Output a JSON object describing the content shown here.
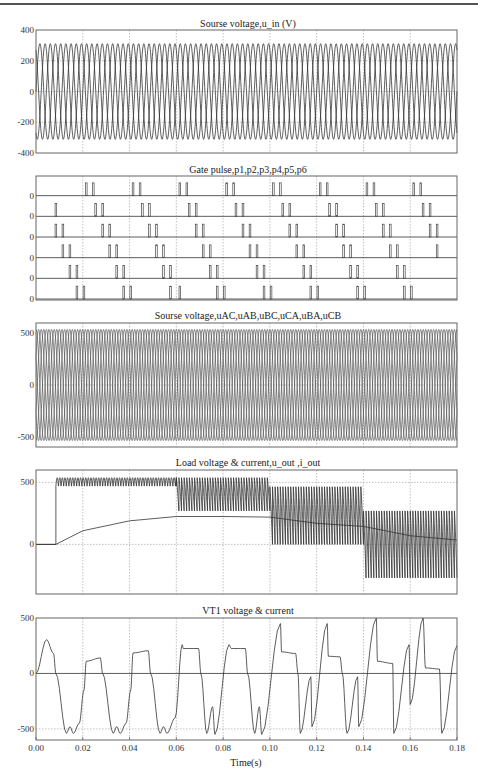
{
  "chart_data": [
    {
      "type": "line",
      "title": "Sourse voltage,u_in (V)",
      "xlabel": "",
      "ylabel": "",
      "xlim": [
        0,
        0.18
      ],
      "ylim": [
        -400,
        400
      ],
      "yticks": [
        "400",
        "200",
        "0",
        "-200",
        "-400"
      ],
      "grid": true,
      "series": [
        {
          "name": "u_a",
          "amplitude": 311,
          "frequency_hz": 150,
          "phase_deg": 0
        },
        {
          "name": "u_b",
          "amplitude": 311,
          "frequency_hz": 150,
          "phase_deg": -120
        },
        {
          "name": "u_c",
          "amplitude": 311,
          "frequency_hz": 150,
          "phase_deg": 120
        }
      ]
    },
    {
      "type": "line",
      "title": "Gate pulse,p1,p2,p3,p4,p5,p6",
      "xlabel": "",
      "xlim": [
        0,
        0.18
      ],
      "yticks": [
        "0",
        "0",
        "0",
        "0",
        "0",
        "0"
      ],
      "grid": true,
      "series": [
        {
          "name": "p1",
          "pulse_times": [
            0.0215,
            0.0245,
            0.0415,
            0.0445,
            0.0615,
            0.0645,
            0.0815,
            0.0845,
            0.1015,
            0.1045,
            0.1215,
            0.1245,
            0.1415,
            0.1445,
            0.1615,
            0.1645
          ]
        },
        {
          "name": "p2",
          "pulse_times": [
            0.0085,
            0.0255,
            0.0285,
            0.0455,
            0.0485,
            0.0655,
            0.0685,
            0.0855,
            0.0885,
            0.1055,
            0.1085,
            0.1255,
            0.1285,
            0.1455,
            0.1485,
            0.1655,
            0.1685
          ]
        },
        {
          "name": "p3",
          "pulse_times": [
            0.0085,
            0.0115,
            0.0285,
            0.0315,
            0.0485,
            0.0515,
            0.0685,
            0.0715,
            0.0885,
            0.0915,
            0.1085,
            0.1115,
            0.1285,
            0.1315,
            0.1485,
            0.1515,
            0.1685,
            0.1715
          ]
        },
        {
          "name": "p4",
          "pulse_times": [
            0.0115,
            0.0145,
            0.0315,
            0.0345,
            0.0515,
            0.0545,
            0.0715,
            0.0745,
            0.0915,
            0.0945,
            0.1115,
            0.1145,
            0.1315,
            0.1345,
            0.1515,
            0.1545,
            0.1715
          ]
        },
        {
          "name": "p5",
          "pulse_times": [
            0.0145,
            0.0175,
            0.0345,
            0.0375,
            0.0545,
            0.0575,
            0.0745,
            0.0775,
            0.0945,
            0.0975,
            0.1145,
            0.1175,
            0.1345,
            0.1375,
            0.1545,
            0.1575
          ]
        },
        {
          "name": "p6",
          "pulse_times": [
            0.0175,
            0.0205,
            0.0375,
            0.0405,
            0.0575,
            0.0615,
            0.0775,
            0.0805,
            0.0975,
            0.1005,
            0.1175,
            0.1205,
            0.1375,
            0.1405,
            0.1575,
            0.1605
          ]
        }
      ]
    },
    {
      "type": "line",
      "title": "Sourse voltage,uAC,uAB,uBC,uCA,uBA,uCB",
      "xlabel": "",
      "xlim": [
        0,
        0.18
      ],
      "ylim": [
        -600,
        600
      ],
      "yticks": [
        "500",
        "0",
        "-500"
      ],
      "grid": true,
      "series": [
        {
          "name": "uAC",
          "amplitude": 538,
          "frequency_hz": 150,
          "phase_deg": -30
        },
        {
          "name": "uAB",
          "amplitude": 538,
          "frequency_hz": 150,
          "phase_deg": 30
        },
        {
          "name": "uBC",
          "amplitude": 538,
          "frequency_hz": 150,
          "phase_deg": -90
        },
        {
          "name": "uCA",
          "amplitude": 538,
          "frequency_hz": 150,
          "phase_deg": 150
        },
        {
          "name": "uBA",
          "amplitude": 538,
          "frequency_hz": 150,
          "phase_deg": 210
        },
        {
          "name": "uCB",
          "amplitude": 538,
          "frequency_hz": 150,
          "phase_deg": 90
        }
      ]
    },
    {
      "type": "line",
      "title": "Load voltage & current,u_out ,i_out",
      "xlabel": "",
      "xlim": [
        0,
        0.18
      ],
      "ylim": [
        -400,
        600
      ],
      "yticks": [
        "500",
        "0"
      ],
      "grid": true,
      "series": [
        {
          "name": "u_out",
          "segments": [
            {
              "t_start": 0.0,
              "t_end": 0.0085,
              "value": 0
            },
            {
              "t_start": 0.0085,
              "t_end": 0.06,
              "ripple_min": 470,
              "ripple_max": 538
            },
            {
              "t_start": 0.06,
              "t_end": 0.1,
              "ripple_min": 270,
              "ripple_max": 538
            },
            {
              "t_start": 0.1,
              "t_end": 0.14,
              "ripple_min": 0,
              "ripple_max": 465
            },
            {
              "t_start": 0.14,
              "t_end": 0.18,
              "ripple_min": -270,
              "ripple_max": 270
            }
          ]
        },
        {
          "name": "i_out",
          "points": [
            [
              0.0,
              0
            ],
            [
              0.0085,
              0
            ],
            [
              0.02,
              110
            ],
            [
              0.04,
              190
            ],
            [
              0.06,
              225
            ],
            [
              0.08,
              225
            ],
            [
              0.1,
              220
            ],
            [
              0.12,
              170
            ],
            [
              0.14,
              145
            ],
            [
              0.16,
              70
            ],
            [
              0.18,
              35
            ]
          ]
        }
      ]
    },
    {
      "type": "line",
      "title": "VT1 voltage & current",
      "xlabel": "Time(s)",
      "xlim": [
        0,
        0.18
      ],
      "ylim": [
        -600,
        500
      ],
      "xticks": [
        "0.00",
        "0.02",
        "0.04",
        "0.06",
        "0.08",
        "0.10",
        "0.12",
        "0.14",
        "0.16",
        "0.18"
      ],
      "yticks": [
        "500",
        "0",
        "-500"
      ],
      "grid": true,
      "series": [
        {
          "name": "VT1_voltage",
          "points": [
            [
              0.0,
              0
            ],
            [
              0.0045,
              305
            ],
            [
              0.0075,
              180
            ],
            [
              0.0085,
              0
            ],
            [
              0.013,
              -540
            ],
            [
              0.0145,
              -480
            ],
            [
              0.016,
              -540
            ],
            [
              0.0185,
              -450
            ],
            [
              0.0205,
              -150
            ],
            [
              0.0215,
              110
            ],
            [
              0.0275,
              140
            ],
            [
              0.0285,
              0
            ],
            [
              0.033,
              -540
            ],
            [
              0.0345,
              -480
            ],
            [
              0.036,
              -540
            ],
            [
              0.0385,
              -450
            ],
            [
              0.0405,
              -150
            ],
            [
              0.0415,
              185
            ],
            [
              0.048,
              205
            ],
            [
              0.049,
              0
            ],
            [
              0.053,
              -540
            ],
            [
              0.0545,
              -480
            ],
            [
              0.056,
              -540
            ],
            [
              0.0595,
              -400
            ],
            [
              0.0625,
              260
            ],
            [
              0.063,
              225
            ],
            [
              0.0695,
              225
            ],
            [
              0.0705,
              0
            ],
            [
              0.073,
              -540
            ],
            [
              0.0755,
              -300
            ],
            [
              0.0765,
              -550
            ],
            [
              0.0825,
              260
            ],
            [
              0.0835,
              225
            ],
            [
              0.0895,
              225
            ],
            [
              0.0905,
              0
            ],
            [
              0.0935,
              -540
            ],
            [
              0.0955,
              -300
            ],
            [
              0.0965,
              -550
            ],
            [
              0.1045,
              450
            ],
            [
              0.105,
              195
            ],
            [
              0.111,
              180
            ],
            [
              0.112,
              0
            ],
            [
              0.113,
              -540
            ],
            [
              0.1175,
              -30
            ],
            [
              0.118,
              -480
            ],
            [
              0.1245,
              450
            ],
            [
              0.125,
              155
            ],
            [
              0.13,
              150
            ],
            [
              0.131,
              0
            ],
            [
              0.133,
              -540
            ],
            [
              0.1375,
              -30
            ],
            [
              0.138,
              -480
            ],
            [
              0.1455,
              500
            ],
            [
              0.146,
              110
            ],
            [
              0.1525,
              90
            ],
            [
              0.153,
              -540
            ],
            [
              0.1595,
              260
            ],
            [
              0.16,
              -280
            ],
            [
              0.1655,
              500
            ],
            [
              0.1665,
              50
            ],
            [
              0.1725,
              40
            ],
            [
              0.1735,
              -540
            ],
            [
              0.18,
              250
            ]
          ]
        },
        {
          "name": "VT1_current",
          "points": [
            [
              0.0,
              0
            ],
            [
              0.18,
              0
            ]
          ]
        }
      ]
    }
  ]
}
